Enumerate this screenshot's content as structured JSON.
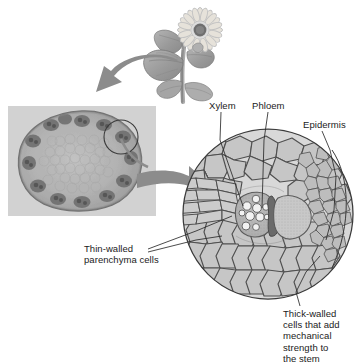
{
  "figure": {
    "title_fragment": "",
    "background_color": "#ffffff"
  },
  "plant": {
    "name": "sunflower-plant-photo",
    "description": "sunflower plant with stem and leaves"
  },
  "micrograph": {
    "name": "stem-cross-section-micrograph",
    "panel_color": "#d2d2d2",
    "highlight_circle": "vascular bundle"
  },
  "arrows": [
    {
      "name": "arrow-plant-to-micrograph",
      "direction": "left",
      "color": "#8c8c8c"
    },
    {
      "name": "arrow-micrograph-to-detail",
      "direction": "right",
      "color": "#8c8c8c"
    }
  ],
  "magnified": {
    "name": "magnified-vascular-bundle-diagram",
    "regions": {
      "xylem": "xylem tissue with vessels",
      "phloem": "phloem tissue",
      "cambium": "cambium strip"
    }
  },
  "labels": {
    "xylem": "Xylem",
    "phloem": "Phloem",
    "epidermis": "Epidermis",
    "thin_walled": "Thin-walled\nparenchyma cells",
    "thick_walled": "Thick-walled\ncells that add\nmechanical\nstrength to\nthe stem"
  },
  "colors": {
    "text": "#1b1b1b",
    "leader_line": "#2a2a2a",
    "arrow": "#8c8c8c",
    "cell_fill": "#c9c9c9",
    "cell_stroke": "#5a5a5a",
    "panel": "#d2d2d2"
  }
}
